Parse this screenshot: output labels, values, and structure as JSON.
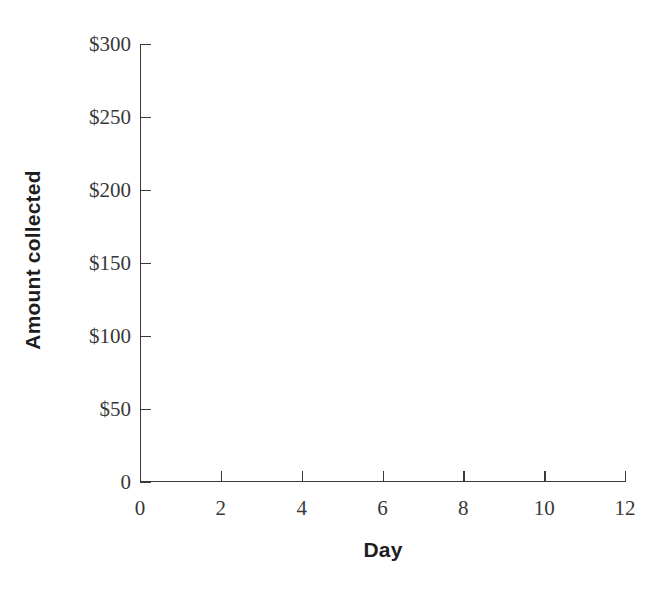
{
  "chart_data": {
    "type": "line",
    "title": "",
    "xlabel": "Day",
    "ylabel": "Amount collected",
    "xlim": [
      0,
      12
    ],
    "ylim": [
      0,
      300
    ],
    "grid": false,
    "legend": false,
    "x_ticks": [
      {
        "value": 0,
        "label": "0"
      },
      {
        "value": 2,
        "label": "2"
      },
      {
        "value": 4,
        "label": "4"
      },
      {
        "value": 6,
        "label": "6"
      },
      {
        "value": 8,
        "label": "8"
      },
      {
        "value": 10,
        "label": "10"
      },
      {
        "value": 12,
        "label": "12"
      }
    ],
    "y_ticks": [
      {
        "value": 0,
        "label": "0"
      },
      {
        "value": 50,
        "label": "$50"
      },
      {
        "value": 100,
        "label": "$100"
      },
      {
        "value": 150,
        "label": "$150"
      },
      {
        "value": 200,
        "label": "$200"
      },
      {
        "value": 250,
        "label": "$250"
      },
      {
        "value": 300,
        "label": "$300"
      }
    ],
    "series": [],
    "annotations": [],
    "note": "Blank plot template: axes are drawn and labeled but no data is plotted."
  },
  "style": {
    "background": "#ffffff",
    "axis_color": "#3a3a3a",
    "tick_label_color": "#38383a",
    "axis_title_color": "#1d1d1f"
  }
}
